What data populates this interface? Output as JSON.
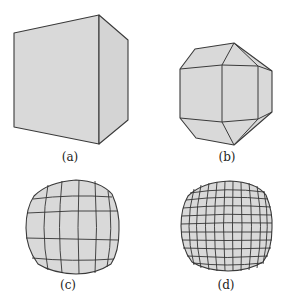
{
  "figure": {
    "background": "#ffffff",
    "fill_color": "#d9d9d9",
    "stroke_color": "#3a3a3a",
    "panels": [
      {
        "id": "a",
        "label": "(a)",
        "description": "cube"
      },
      {
        "id": "b",
        "label": "(b)",
        "description": "cube with beveled edges (one subdivision)"
      },
      {
        "id": "c",
        "label": "(c)",
        "description": "rounded cube, coarse grid subdivision"
      },
      {
        "id": "d",
        "label": "(d)",
        "description": "rounded cube, fine grid subdivision"
      }
    ]
  }
}
